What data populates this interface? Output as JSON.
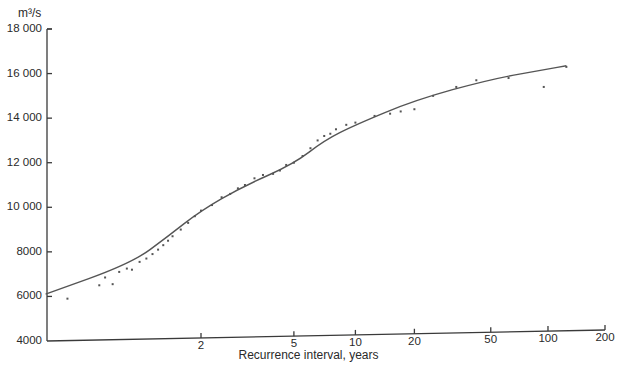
{
  "chart_data": {
    "type": "scatter",
    "title": "",
    "xlabel": "Recurrence interval, years",
    "ylabel": "m³/s",
    "x_scale": "probability (Gumbel-type, log-like)",
    "ylim": [
      4000,
      18000
    ],
    "xlim": [
      1.0,
      200
    ],
    "y_ticks": [
      "4000",
      "6000",
      "8000",
      "10 000",
      "12 000",
      "14 000",
      "16 000",
      "18 000"
    ],
    "x_ticks": [
      "2",
      "5",
      "10",
      "20",
      "50",
      "100",
      "200"
    ],
    "grid": false,
    "legend": null,
    "series": [
      {
        "name": "Fitted frequency curve",
        "kind": "line",
        "points": [
          {
            "x": 1.01,
            "y": 6100
          },
          {
            "x": 1.25,
            "y": 7500
          },
          {
            "x": 1.55,
            "y": 8700
          },
          {
            "x": 2,
            "y": 9850
          },
          {
            "x": 2.9,
            "y": 10900
          },
          {
            "x": 5,
            "y": 11950
          },
          {
            "x": 7,
            "y": 13000
          },
          {
            "x": 10,
            "y": 13700
          },
          {
            "x": 20,
            "y": 14800
          },
          {
            "x": 50,
            "y": 15750
          },
          {
            "x": 100,
            "y": 16200
          },
          {
            "x": 125,
            "y": 16350
          }
        ]
      },
      {
        "name": "Observed annual floods",
        "kind": "scatter",
        "points": [
          {
            "x": 1.0,
            "y": 5200
          },
          {
            "x": 1.03,
            "y": 5900
          },
          {
            "x": 1.1,
            "y": 6500
          },
          {
            "x": 1.12,
            "y": 6850
          },
          {
            "x": 1.15,
            "y": 6550
          },
          {
            "x": 1.18,
            "y": 7100
          },
          {
            "x": 1.22,
            "y": 7250
          },
          {
            "x": 1.25,
            "y": 7200
          },
          {
            "x": 1.3,
            "y": 7550
          },
          {
            "x": 1.35,
            "y": 7700
          },
          {
            "x": 1.4,
            "y": 7900
          },
          {
            "x": 1.45,
            "y": 8100
          },
          {
            "x": 1.5,
            "y": 8300
          },
          {
            "x": 1.55,
            "y": 8500
          },
          {
            "x": 1.6,
            "y": 8700
          },
          {
            "x": 1.7,
            "y": 9000
          },
          {
            "x": 1.8,
            "y": 9300
          },
          {
            "x": 1.9,
            "y": 9600
          },
          {
            "x": 2.0,
            "y": 9850
          },
          {
            "x": 2.2,
            "y": 10100
          },
          {
            "x": 2.4,
            "y": 10450
          },
          {
            "x": 2.6,
            "y": 10600
          },
          {
            "x": 2.8,
            "y": 10850
          },
          {
            "x": 3.0,
            "y": 11000
          },
          {
            "x": 3.3,
            "y": 11300
          },
          {
            "x": 3.6,
            "y": 11450
          },
          {
            "x": 4.0,
            "y": 11500
          },
          {
            "x": 4.3,
            "y": 11650
          },
          {
            "x": 4.6,
            "y": 11900
          },
          {
            "x": 5.0,
            "y": 12000
          },
          {
            "x": 5.5,
            "y": 12300
          },
          {
            "x": 6.0,
            "y": 12650
          },
          {
            "x": 6.5,
            "y": 13000
          },
          {
            "x": 7.0,
            "y": 13200
          },
          {
            "x": 7.5,
            "y": 13300
          },
          {
            "x": 8.0,
            "y": 13500
          },
          {
            "x": 9.0,
            "y": 13700
          },
          {
            "x": 10.0,
            "y": 13800
          },
          {
            "x": 12.5,
            "y": 14100
          },
          {
            "x": 15.0,
            "y": 14200
          },
          {
            "x": 17.0,
            "y": 14300
          },
          {
            "x": 20.0,
            "y": 14400
          },
          {
            "x": 25.0,
            "y": 15000
          },
          {
            "x": 33.0,
            "y": 15400
          },
          {
            "x": 42.0,
            "y": 15700
          },
          {
            "x": 62.0,
            "y": 15800
          },
          {
            "x": 95.0,
            "y": 15400
          },
          {
            "x": 125.0,
            "y": 16300
          }
        ]
      }
    ]
  },
  "labels": {
    "y_unit": "m³/s",
    "x_axis": "Recurrence interval, years"
  },
  "colors": {
    "ink": "#3a3a3a",
    "background": "#ffffff"
  }
}
